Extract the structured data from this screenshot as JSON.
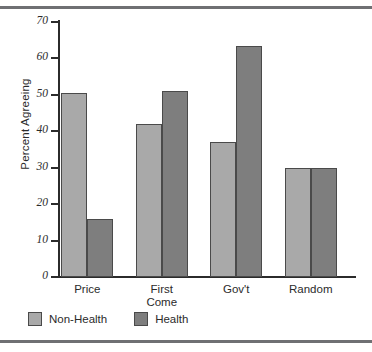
{
  "chart_data": {
    "type": "bar",
    "title": "",
    "subtitle": "",
    "xlabel": "",
    "ylabel": "Percent Agreeing",
    "ylim": [
      0,
      70
    ],
    "yticks": [
      0,
      10,
      20,
      30,
      40,
      50,
      60,
      70
    ],
    "ytick_labels": [
      "0",
      "10",
      "20",
      "30",
      "40",
      "50",
      "60",
      "70"
    ],
    "grid": false,
    "legend_position": "bottom-left",
    "categories": [
      "Price",
      "First Come",
      "Gov't",
      "Random"
    ],
    "category_lines": [
      [
        "Price"
      ],
      [
        "First",
        "Come"
      ],
      [
        "Gov't"
      ],
      [
        "Random"
      ]
    ],
    "series": [
      {
        "name": "Non-Health",
        "color": "#a9a9a9",
        "values": [
          50.5,
          42,
          37,
          30
        ]
      },
      {
        "name": "Health",
        "color": "#7e7e7e",
        "values": [
          16,
          51,
          63.5,
          30
        ]
      }
    ]
  },
  "legend": {
    "items": [
      {
        "label": "Non-Health",
        "swatch": "light-gray-swatch"
      },
      {
        "label": "Health",
        "swatch": "dark-gray-swatch"
      }
    ]
  }
}
